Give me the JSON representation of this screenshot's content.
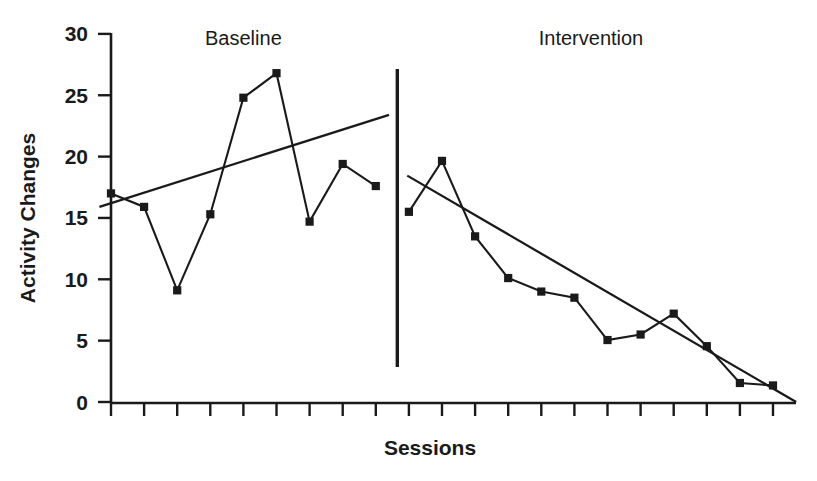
{
  "chart_data": {
    "type": "line",
    "title": "",
    "xlabel": "Sessions",
    "ylabel": "Activity Changes",
    "ylim": [
      0,
      30
    ],
    "yticks": [
      0,
      5,
      10,
      15,
      20,
      25,
      30
    ],
    "ytick_labels": [
      "0",
      "5",
      "10",
      "15",
      "20",
      "25",
      "30"
    ],
    "xticks_count": 21,
    "xtick_labels": [],
    "grid": false,
    "legend": false,
    "phases": [
      {
        "name": "Baseline",
        "label": "Baseline",
        "sessions": [
          1,
          2,
          3,
          4,
          5,
          6,
          7,
          8,
          9
        ],
        "values": [
          17.0,
          15.9,
          9.1,
          15.3,
          24.8,
          26.8,
          14.7,
          19.4,
          17.6
        ],
        "trend": {
          "x_start": 0.65,
          "y_start": 15.9,
          "x_end": 9.4,
          "y_end": 23.4
        }
      },
      {
        "name": "Intervention",
        "label": "Intervention",
        "sessions": [
          10,
          11,
          12,
          13,
          14,
          15,
          16,
          17,
          18,
          19,
          20,
          21
        ],
        "values": [
          15.5,
          19.65,
          13.5,
          10.1,
          9.0,
          8.5,
          5.05,
          5.5,
          7.2,
          4.55,
          1.55,
          1.35
        ],
        "trend": {
          "x_start": 9.95,
          "y_start": 18.45,
          "x_end": 21.7,
          "y_end": 0.0
        }
      }
    ],
    "phase_divider_session": 9.65,
    "colors": {
      "ink": "#1a1a1a",
      "background": "#ffffff",
      "series": "#1a1a1a",
      "trend": "#1a1a1a"
    }
  }
}
